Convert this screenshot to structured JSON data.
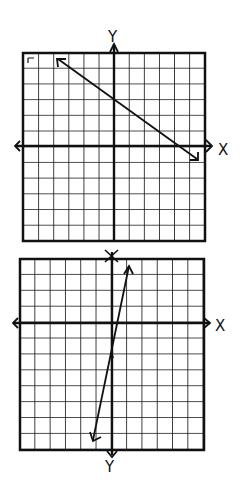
{
  "graphs": [
    {
      "id": "top",
      "x_label": "X",
      "y_label": "Y",
      "grid_cells": 12,
      "line": {
        "from": [
          -6,
          6
        ],
        "to": [
          6,
          -1
        ],
        "description": "line with negative slope, arrows at both ends"
      }
    },
    {
      "id": "bottom",
      "x_label": "X",
      "y_label_top": "Y",
      "y_label_bottom": "Y",
      "grid_cells": 12,
      "line": {
        "from": [
          1,
          6
        ],
        "to": [
          -1,
          -6
        ],
        "passes_through": [
          0,
          -2
        ],
        "description": "steep line with positive slope, arrows at both ends"
      }
    }
  ],
  "colors": {
    "ink": "#111111",
    "paper": "#ffffff"
  }
}
